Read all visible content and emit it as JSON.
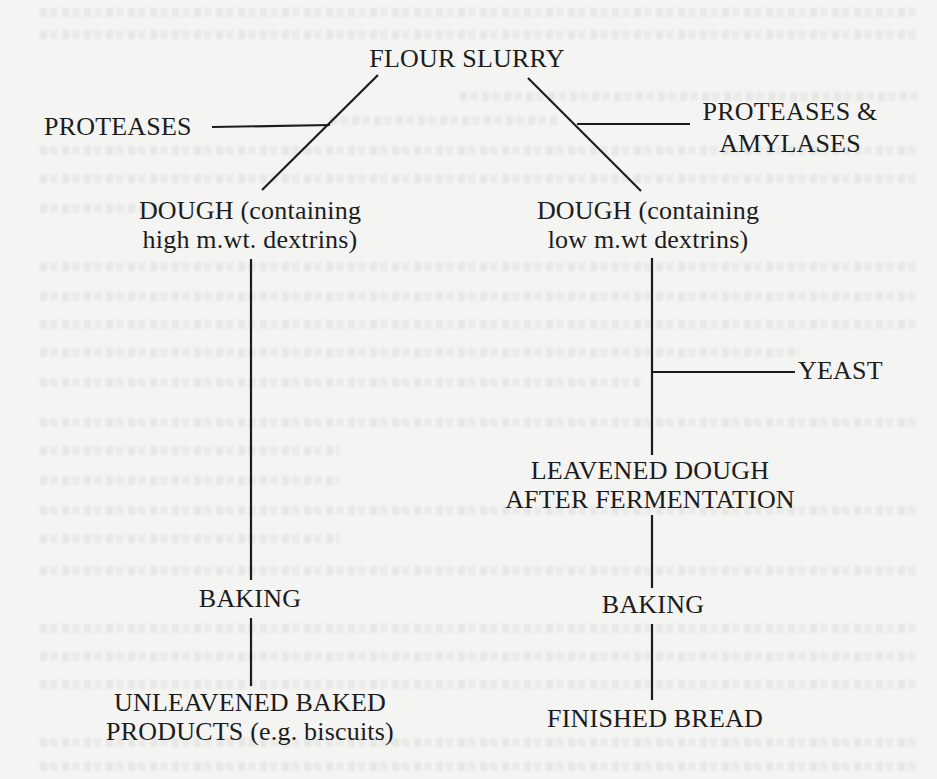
{
  "diagram": {
    "type": "flowchart",
    "nodes": {
      "flour_slurry": "FLOUR SLURRY",
      "proteases": "PROTEASES",
      "proteases_amylases_line1": "PROTEASES &",
      "proteases_amylases_line2": "AMYLASES",
      "dough_high_line1": "DOUGH (containing",
      "dough_high_line2": "high m.wt. dextrins)",
      "dough_low_line1": "DOUGH (containing",
      "dough_low_line2": "low m.wt dextrins)",
      "yeast": "YEAST",
      "leavened_line1": "LEAVENED DOUGH",
      "leavened_line2": "AFTER FERMENTATION",
      "baking_left": "BAKING",
      "baking_right": "BAKING",
      "unleavened_line1": "UNLEAVENED BAKED",
      "unleavened_line2": "PRODUCTS (e.g. biscuits)",
      "finished_bread": "FINISHED BREAD"
    },
    "edges": [
      {
        "from": "FLOUR SLURRY",
        "to": "DOUGH (containing high m.wt. dextrins)",
        "input": "PROTEASES"
      },
      {
        "from": "FLOUR SLURRY",
        "to": "DOUGH (containing low m.wt dextrins)",
        "input": "PROTEASES & AMYLASES"
      },
      {
        "from": "DOUGH (containing high m.wt. dextrins)",
        "to": "BAKING"
      },
      {
        "from": "BAKING",
        "to": "UNLEAVENED BAKED PRODUCTS (e.g. biscuits)"
      },
      {
        "from": "DOUGH (containing low m.wt dextrins)",
        "to": "LEAVENED DOUGH AFTER FERMENTATION",
        "input": "YEAST"
      },
      {
        "from": "LEAVENED DOUGH AFTER FERMENTATION",
        "to": "BAKING"
      },
      {
        "from": "BAKING",
        "to": "FINISHED BREAD"
      }
    ],
    "colors": {
      "ink": "#1c1c1c",
      "paper": "#f4f4f2"
    }
  }
}
